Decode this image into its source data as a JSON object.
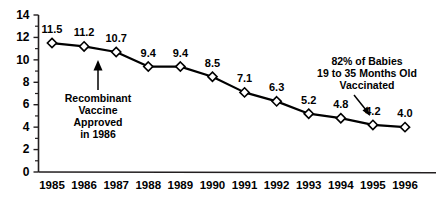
{
  "chart_data": {
    "type": "line",
    "title": "",
    "subtitle": "",
    "xlabel": "",
    "ylabel": "",
    "categories": [
      "1985",
      "1986",
      "1987",
      "1988",
      "1989",
      "1990",
      "1991",
      "1992",
      "1993",
      "1994",
      "1995",
      "1996"
    ],
    "values": [
      11.5,
      11.2,
      10.7,
      9.4,
      9.4,
      8.5,
      7.1,
      6.3,
      5.2,
      4.8,
      4.2,
      4.0
    ],
    "point_labels": [
      "11.5",
      "11.2",
      "10.7",
      "9.4",
      "9.4",
      "8.5",
      "7.1",
      "6.3",
      "5.2",
      "4.8",
      "4.2",
      "4.0"
    ],
    "ylim": [
      0,
      14
    ],
    "ytick_labels": [
      "14",
      "12",
      "10",
      "8",
      "6",
      "4",
      "2",
      "0"
    ],
    "ytick_values": [
      14,
      12,
      10,
      8,
      6,
      4,
      2,
      0
    ],
    "yminor_values": [
      13,
      11,
      9,
      7,
      5,
      3,
      1
    ],
    "grid": false,
    "legend": null,
    "marker": "open-diamond",
    "line_color": "#000000",
    "marker_fill": "#ffffff",
    "marker_edge": "#000000",
    "annotations": [
      {
        "id": "recombinant-vaccine",
        "lines": [
          "Recombinant",
          "Vaccine",
          "Approved",
          "in 1986"
        ],
        "target_category": "1986",
        "target_value": 11.2,
        "arrow": "up"
      },
      {
        "id": "babies-vaccinated",
        "lines": [
          "82% of Babies",
          "19 to 35 Months Old",
          "Vaccinated"
        ],
        "target_category": "1996",
        "target_value": 4.0,
        "arrow": "down-right"
      }
    ]
  }
}
